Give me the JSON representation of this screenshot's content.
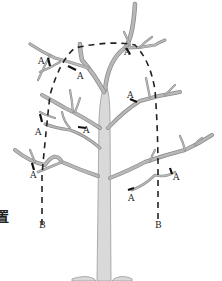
{
  "figure": {
    "side_text": "置",
    "labels": {
      "cut_point": "A",
      "boundary": "B"
    },
    "cut_labels": [
      {
        "id": "a1",
        "text": "A"
      },
      {
        "id": "a2",
        "text": "A"
      },
      {
        "id": "a3",
        "text": "A"
      },
      {
        "id": "a4",
        "text": "A"
      },
      {
        "id": "a5",
        "text": "A"
      },
      {
        "id": "a6",
        "text": "A"
      },
      {
        "id": "a7",
        "text": "A"
      },
      {
        "id": "a8",
        "text": "A"
      },
      {
        "id": "a9",
        "text": "A"
      }
    ],
    "boundary_labels": [
      {
        "id": "b-left",
        "text": "B"
      },
      {
        "id": "b-right",
        "text": "B"
      }
    ],
    "colors": {
      "trunk_fill": "#d9d9d9",
      "trunk_outline": "#9a9a9a",
      "dashed_line": "#222222",
      "cut_mark": "#111111"
    }
  }
}
